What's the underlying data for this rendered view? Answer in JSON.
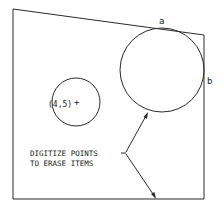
{
  "diagram": {
    "points": {
      "a_label": "a",
      "b_label": "b"
    },
    "coordinate_label": "(4,5)",
    "cursor_glyph": "+",
    "instruction": {
      "line1": "DIGITIZE POINTS",
      "line2": "TO ERASE ITEMS"
    },
    "colors": {
      "stroke": "#2a2a2a",
      "background": "#ffffff"
    }
  }
}
